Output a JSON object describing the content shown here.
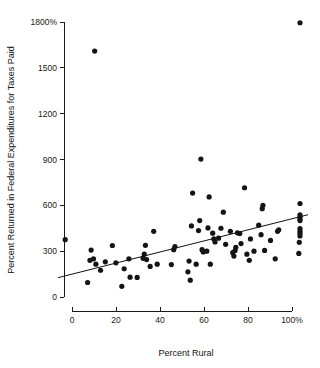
{
  "chart_data": {
    "type": "scatter",
    "title": "",
    "xlabel": "Percent Rural",
    "ylabel": "Percent Returned in Federal Expenditures for Taxes Paid",
    "xlim": [
      0,
      100
    ],
    "ylim": [
      0,
      1800
    ],
    "grid": false,
    "legend": null,
    "x_ticks": [
      {
        "value": 0,
        "label": "0"
      },
      {
        "value": 20,
        "label": "20"
      },
      {
        "value": 40,
        "label": "40"
      },
      {
        "value": 60,
        "label": "60"
      },
      {
        "value": 80,
        "label": "80"
      },
      {
        "value": 100,
        "label": "100%"
      }
    ],
    "y_ticks": [
      {
        "value": 1800,
        "label": "1800%"
      },
      {
        "value": 1500,
        "label": "1500"
      },
      {
        "value": 1200,
        "label": "1200"
      },
      {
        "value": 900,
        "label": "900"
      },
      {
        "value": 600,
        "label": "600"
      },
      {
        "value": 300,
        "label": "300"
      },
      {
        "value": 0,
        "label": "0"
      }
    ],
    "marker": {
      "shape": "circle",
      "radius_px": 2.6,
      "color": "#141414"
    },
    "trend_line": {
      "type": "linear-regression",
      "x_start": 0,
      "y_start": 133,
      "x_end": 100,
      "y_end": 530,
      "color": "#111111"
    },
    "points": [
      {
        "x": 0.5,
        "y": 375
      },
      {
        "x": 10.0,
        "y": 95
      },
      {
        "x": 11.0,
        "y": 240
      },
      {
        "x": 11.5,
        "y": 307
      },
      {
        "x": 12.5,
        "y": 250
      },
      {
        "x": 13.0,
        "y": 1610
      },
      {
        "x": 13.5,
        "y": 215
      },
      {
        "x": 15.5,
        "y": 175
      },
      {
        "x": 17.5,
        "y": 230
      },
      {
        "x": 20.5,
        "y": 337
      },
      {
        "x": 22.0,
        "y": 224
      },
      {
        "x": 24.5,
        "y": 70
      },
      {
        "x": 25.5,
        "y": 185
      },
      {
        "x": 27.5,
        "y": 250
      },
      {
        "x": 28.0,
        "y": 130
      },
      {
        "x": 31.0,
        "y": 128
      },
      {
        "x": 33.5,
        "y": 253
      },
      {
        "x": 34.0,
        "y": 280
      },
      {
        "x": 34.5,
        "y": 338
      },
      {
        "x": 35.0,
        "y": 245
      },
      {
        "x": 36.5,
        "y": 200
      },
      {
        "x": 38.0,
        "y": 430
      },
      {
        "x": 39.5,
        "y": 215
      },
      {
        "x": 45.5,
        "y": 212
      },
      {
        "x": 46.5,
        "y": 310
      },
      {
        "x": 47.0,
        "y": 330
      },
      {
        "x": 52.5,
        "y": 165
      },
      {
        "x": 53.0,
        "y": 235
      },
      {
        "x": 53.5,
        "y": 110
      },
      {
        "x": 54.0,
        "y": 465
      },
      {
        "x": 54.5,
        "y": 680
      },
      {
        "x": 56.0,
        "y": 215
      },
      {
        "x": 57.0,
        "y": 435
      },
      {
        "x": 57.5,
        "y": 500
      },
      {
        "x": 58.0,
        "y": 903
      },
      {
        "x": 58.5,
        "y": 310
      },
      {
        "x": 59.0,
        "y": 295
      },
      {
        "x": 60.5,
        "y": 300
      },
      {
        "x": 61.0,
        "y": 452
      },
      {
        "x": 61.5,
        "y": 655
      },
      {
        "x": 62.0,
        "y": 215
      },
      {
        "x": 63.0,
        "y": 418
      },
      {
        "x": 63.5,
        "y": 380
      },
      {
        "x": 64.0,
        "y": 360
      },
      {
        "x": 65.5,
        "y": 385
      },
      {
        "x": 66.5,
        "y": 450
      },
      {
        "x": 67.5,
        "y": 555
      },
      {
        "x": 68.5,
        "y": 345
      },
      {
        "x": 70.5,
        "y": 430
      },
      {
        "x": 71.5,
        "y": 290
      },
      {
        "x": 72.0,
        "y": 268
      },
      {
        "x": 72.5,
        "y": 305
      },
      {
        "x": 72.8,
        "y": 325
      },
      {
        "x": 73.5,
        "y": 420
      },
      {
        "x": 74.5,
        "y": 415
      },
      {
        "x": 75.0,
        "y": 350
      },
      {
        "x": 76.5,
        "y": 715
      },
      {
        "x": 77.5,
        "y": 280
      },
      {
        "x": 78.5,
        "y": 240
      },
      {
        "x": 79.0,
        "y": 380
      },
      {
        "x": 80.5,
        "y": 300
      },
      {
        "x": 82.5,
        "y": 470
      },
      {
        "x": 83.5,
        "y": 408
      },
      {
        "x": 84.0,
        "y": 578
      },
      {
        "x": 84.3,
        "y": 600
      },
      {
        "x": 85.0,
        "y": 305
      },
      {
        "x": 87.5,
        "y": 370
      },
      {
        "x": 89.5,
        "y": 250
      },
      {
        "x": 90.5,
        "y": 430
      },
      {
        "x": 91.0,
        "y": 440
      },
      {
        "x": 99.5,
        "y": 285
      },
      {
        "x": 99.7,
        "y": 358
      },
      {
        "x": 100.0,
        "y": 400
      },
      {
        "x": 100.0,
        "y": 418
      },
      {
        "x": 100.0,
        "y": 432
      },
      {
        "x": 100.0,
        "y": 448
      },
      {
        "x": 100.0,
        "y": 500
      },
      {
        "x": 100.0,
        "y": 512
      },
      {
        "x": 100.0,
        "y": 525
      },
      {
        "x": 100.0,
        "y": 538
      },
      {
        "x": 100.0,
        "y": 612
      },
      {
        "x": 100.0,
        "y": 1795
      }
    ]
  },
  "plot_geometry": {
    "left_px": 64,
    "right_px": 300,
    "top_px": 22,
    "bottom_px": 297,
    "x_axis_line_y": 311,
    "x_axis_left_px": 72,
    "x_axis_right_px": 292
  }
}
